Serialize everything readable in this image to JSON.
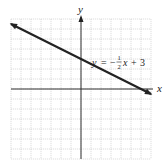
{
  "chart_data": {
    "type": "line",
    "title": "",
    "xlabel": "x",
    "ylabel": "y",
    "xlim": [
      -7,
      7
    ],
    "ylim": [
      -7,
      7
    ],
    "grid": true,
    "grid_step": 1,
    "tick_labels": "none",
    "series": [
      {
        "name": "y = -1/2 x + 3",
        "equation": "y = -½x + 3",
        "slope": -0.5,
        "intercept": 3,
        "x": [
          -7,
          7
        ],
        "y": [
          6.5,
          -0.5
        ],
        "arrows": "both"
      }
    ],
    "annotations": [
      {
        "text": "y = −½x + 3",
        "x": 1,
        "y": 4.5
      }
    ]
  },
  "labels": {
    "x_axis": "x",
    "y_axis": "y",
    "eq_y": "y",
    "eq_eq": "=",
    "eq_minus": "−",
    "eq_num": "1",
    "eq_den": "2",
    "eq_x": "x",
    "eq_plus": "+",
    "eq_const": "3"
  },
  "colors": {
    "grid": "#c8c8c8",
    "axis": "#333333",
    "line": "#222222",
    "background": "#ffffff"
  }
}
